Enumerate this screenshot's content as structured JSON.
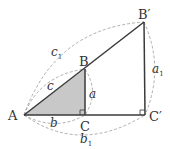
{
  "diagram": {
    "colors": {
      "stroke": "#3a3a3a",
      "fill_small_triangle": "#c8c8c8",
      "dashed": "#9a9a9a",
      "text": "#333333"
    },
    "points": {
      "A": {
        "label": "A",
        "x": 24,
        "y": 115
      },
      "B": {
        "label": "B",
        "x": 85,
        "y": 69
      },
      "C": {
        "label": "C",
        "x": 85,
        "y": 115
      },
      "B_prime": {
        "label": "B′",
        "x": 144,
        "y": 22
      },
      "C_prime": {
        "label": "C′",
        "x": 145,
        "y": 115
      }
    },
    "segment_labels": {
      "a": "a",
      "b": "b",
      "c": "c",
      "a1": "a",
      "a1_sub": "1",
      "b1": "b",
      "b1_sub": "1",
      "c1": "c",
      "c1_sub": "1"
    }
  }
}
